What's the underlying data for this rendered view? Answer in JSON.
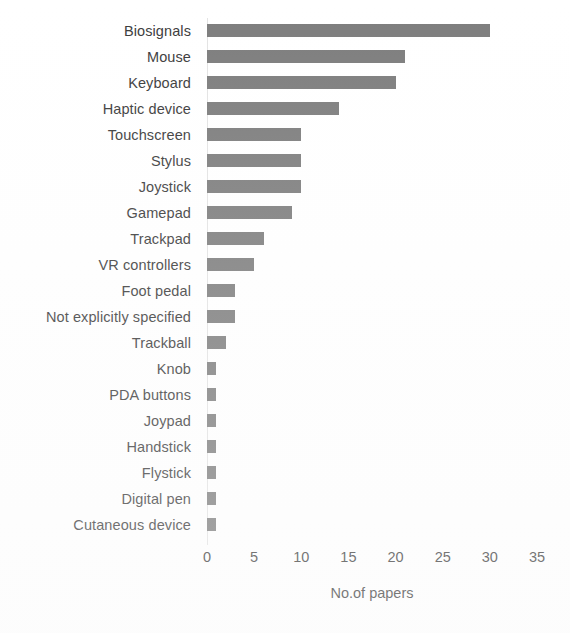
{
  "chart_data": {
    "type": "bar",
    "orientation": "horizontal",
    "title": "",
    "xlabel": "No.of papers",
    "ylabel": "",
    "xlim": [
      0,
      35
    ],
    "xticks": [
      0,
      5,
      10,
      15,
      20,
      25,
      30,
      35
    ],
    "grid": false,
    "legend": null,
    "bar_color": "#7d7d7d",
    "text_color": "#3b3b3b",
    "categories": [
      "Biosignals",
      "Mouse",
      "Keyboard",
      "Haptic device",
      "Touchscreen",
      "Stylus",
      "Joystick",
      "Gamepad",
      "Trackpad",
      "VR controllers",
      "Foot pedal",
      "Not explicitly specified",
      "Trackball",
      "Knob",
      "PDA buttons",
      "Joypad",
      "Handstick",
      "Flystick",
      "Digital pen",
      "Cutaneous device"
    ],
    "values": [
      30,
      21,
      20,
      14,
      10,
      10,
      10,
      9,
      6,
      5,
      3,
      3,
      2,
      1,
      1,
      1,
      1,
      1,
      1,
      1
    ]
  }
}
